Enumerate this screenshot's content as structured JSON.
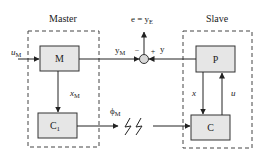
{
  "diagram": {
    "type": "block-diagram",
    "groups": {
      "master": {
        "label": "Master"
      },
      "slave": {
        "label": "Slave"
      }
    },
    "blocks": {
      "M": {
        "label": "M"
      },
      "C1": {
        "label": "C",
        "subscript": "1"
      },
      "P": {
        "label": "P"
      },
      "C": {
        "label": "C"
      }
    },
    "signals": {
      "u_M": {
        "label": "u",
        "subscript": "M"
      },
      "y_M": {
        "label": "y",
        "subscript": "M"
      },
      "x_M": {
        "label": "x",
        "subscript": "M"
      },
      "phi_M": {
        "label": "ϕ",
        "subscript": "M"
      },
      "y": {
        "label": "y"
      },
      "x": {
        "label": "x"
      },
      "u": {
        "label": "u"
      },
      "e": {
        "label": "e = y",
        "subscript": "E"
      }
    },
    "summing_junction": {
      "minus_sign": "−",
      "plus_sign": "+"
    },
    "colors": {
      "block_fill": "#e6e6e6",
      "stroke": "#333333",
      "dashed": "#444444",
      "junction_fill": "#d8d8d8"
    }
  }
}
